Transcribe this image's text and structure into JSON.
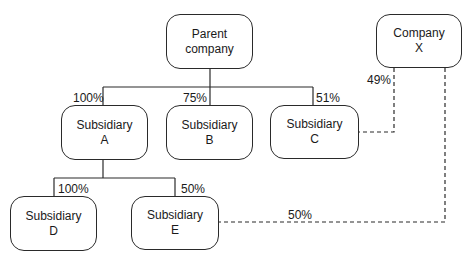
{
  "diagram": {
    "type": "ownership-structure",
    "nodes": [
      {
        "id": "parent",
        "line1": "Parent",
        "line2": "company"
      },
      {
        "id": "company_x",
        "line1": "Company",
        "line2": "X"
      },
      {
        "id": "sub_a",
        "line1": "Subsidiary",
        "line2": "A"
      },
      {
        "id": "sub_b",
        "line1": "Subsidiary",
        "line2": "B"
      },
      {
        "id": "sub_c",
        "line1": "Subsidiary",
        "line2": "C"
      },
      {
        "id": "sub_d",
        "line1": "Subsidiary",
        "line2": "D"
      },
      {
        "id": "sub_e",
        "line1": "Subsidiary",
        "line2": "E"
      }
    ],
    "edges": [
      {
        "from": "parent",
        "to": "sub_a",
        "label": "100%",
        "style": "solid"
      },
      {
        "from": "parent",
        "to": "sub_b",
        "label": "75%",
        "style": "solid"
      },
      {
        "from": "parent",
        "to": "sub_c",
        "label": "51%",
        "style": "solid"
      },
      {
        "from": "company_x",
        "to": "sub_c",
        "label": "49%",
        "style": "dashed"
      },
      {
        "from": "sub_a",
        "to": "sub_d",
        "label": "100%",
        "style": "solid"
      },
      {
        "from": "sub_a",
        "to": "sub_e",
        "label": "50%",
        "style": "solid"
      },
      {
        "from": "company_x",
        "to": "sub_e",
        "label": "50%",
        "style": "dashed"
      }
    ]
  }
}
